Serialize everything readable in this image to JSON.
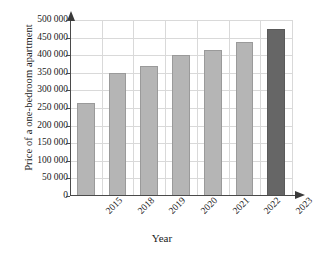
{
  "chart_data": {
    "type": "bar",
    "title": "",
    "xlabel": "Year",
    "ylabel": "Price of a one-bedroom apartment",
    "categories": [
      "2015",
      "2018",
      "2019",
      "2020",
      "2021",
      "2022",
      "2023"
    ],
    "values": [
      265000,
      350000,
      370000,
      400000,
      415000,
      437000,
      475000
    ],
    "ylim": [
      0,
      500000
    ],
    "ytick_values": [
      0,
      50000,
      100000,
      150000,
      200000,
      250000,
      300000,
      350000,
      400000,
      450000,
      500000
    ],
    "ytick_labels": [
      "0",
      "50 000",
      "100 000",
      "150 000",
      "200 000",
      "250 000",
      "300 000",
      "350 000",
      "400 000",
      "450 000",
      "500 000"
    ],
    "grid": true,
    "legend": "none",
    "bar_colors": [
      "#b5b5b5",
      "#b5b5b5",
      "#b5b5b5",
      "#b5b5b5",
      "#b5b5b5",
      "#b5b5b5",
      "#666666"
    ],
    "highlight_category": "2023",
    "colors": {
      "bar_default": "#b5b5b5",
      "bar_highlight": "#666666",
      "bar_border": "#9a9a9a",
      "gridline": "#d9d9d9",
      "axis": "#4a4a4a",
      "text": "#1a1a1a",
      "background": "#ffffff"
    }
  }
}
